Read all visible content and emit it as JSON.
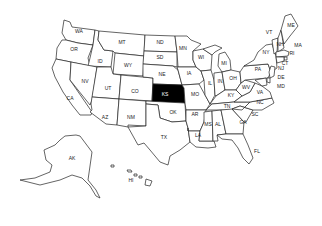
{
  "map": {
    "highlighted_state": "KS",
    "highlight_color": "#000000",
    "default_fill": "#ffffff",
    "stroke_color": "#222222",
    "labels": {
      "WA": "WA",
      "OR": "OR",
      "CA": "CA",
      "ID": "ID",
      "NV": "NV",
      "MT": "MT",
      "WY": "WY",
      "UT": "UT",
      "AZ": "AZ",
      "CO": "CO",
      "NM": "NM",
      "ND": "ND",
      "SD": "SD",
      "NE": "NE",
      "KS": "KS",
      "OK": "OK",
      "TX": "TX",
      "MN": "MN",
      "IA": "IA",
      "MO": "MO",
      "AR": "AR",
      "LA": "LA",
      "WI": "WI",
      "IL": "IL",
      "MI": "MI",
      "IN": "IN",
      "OH": "OH",
      "KY": "KY",
      "TN": "TN",
      "MS": "MS",
      "AL": "AL",
      "GA": "GA",
      "FL": "FL",
      "SC": "SC",
      "NC": "NC",
      "VA": "VA",
      "WV": "WV",
      "PA": "PA",
      "NY": "NY",
      "VT": "VT",
      "NH": "NH",
      "ME": "ME",
      "MA": "MA",
      "RI": "RI",
      "CT": "CT",
      "NJ": "NJ",
      "DE": "DE",
      "MD": "MD",
      "AK": "AK",
      "HI": "HI"
    }
  }
}
